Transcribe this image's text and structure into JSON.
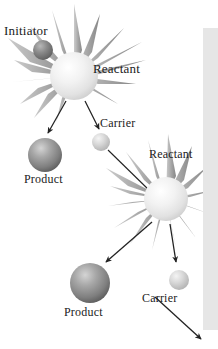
{
  "figure": {
    "background_color": "#ffffff",
    "width": 218,
    "height": 349
  },
  "labels": {
    "initiator": "Initiator",
    "reactant_top": "Reactant",
    "carrier_top": "Carrier",
    "product_top": "Product",
    "reactant_bottom": "Reactant",
    "product_bottom": "Product",
    "carrier_bottom": "Carrier"
  },
  "colors": {
    "text": "#1b1b1b",
    "product_sphere_dark": "#8d8d8d",
    "product_sphere_shadow": "#5e5e5e",
    "product_sphere_highlight": "#cfcfcf",
    "carrier_sphere": "#c9c9c9",
    "carrier_sphere_highlight": "#f2f2f2",
    "reactant_sphere": "#ededed",
    "reactant_sphere_highlight": "#ffffff",
    "initiator_sphere": "#7a7a7a",
    "burst_spike": "#9a9a9a",
    "arrow": "#222222",
    "edge_strip": "#e6e6e6"
  },
  "nodes": [
    {
      "id": "initiator",
      "kind": "initiator-sphere",
      "cx": 43,
      "cy": 50,
      "r": 10
    },
    {
      "id": "reactant-top",
      "kind": "reactant-burst",
      "cx": 74,
      "cy": 76,
      "r": 24
    },
    {
      "id": "carrier-top",
      "kind": "carrier-sphere",
      "cx": 101,
      "cy": 142,
      "r": 9
    },
    {
      "id": "product-top",
      "kind": "product-sphere",
      "cx": 45,
      "cy": 155,
      "r": 17
    },
    {
      "id": "reactant-bottom",
      "kind": "reactant-burst",
      "cx": 166,
      "cy": 199,
      "r": 22
    },
    {
      "id": "product-bottom",
      "kind": "product-sphere",
      "cx": 90,
      "cy": 283,
      "r": 20
    },
    {
      "id": "carrier-bottom",
      "kind": "carrier-sphere",
      "cx": 179,
      "cy": 280,
      "r": 10
    }
  ],
  "arrows": [
    {
      "id": "arrow-reactant-top-to-product-top",
      "x1": 66,
      "y1": 101,
      "x2": 48,
      "y2": 133
    },
    {
      "id": "arrow-reactant-top-to-carrier-top",
      "x1": 85,
      "y1": 101,
      "x2": 99,
      "y2": 129
    },
    {
      "id": "arrow-carrier-top-to-reactant-bottom",
      "x1": 108,
      "y1": 150,
      "x2": 152,
      "y2": 193,
      "arrowhead": false
    },
    {
      "id": "arrow-reactant-bottom-to-product-bottom",
      "x1": 152,
      "y1": 222,
      "x2": 106,
      "y2": 262
    },
    {
      "id": "arrow-reactant-bottom-to-carrier-bottom",
      "x1": 170,
      "y1": 224,
      "x2": 176,
      "y2": 262
    },
    {
      "id": "arrow-carrier-bottom-to-next",
      "x1": 155,
      "y1": 297,
      "x2": 201,
      "y2": 339
    }
  ],
  "edge_strip": {
    "x": 203,
    "y": 28,
    "width": 15,
    "height": 302
  }
}
